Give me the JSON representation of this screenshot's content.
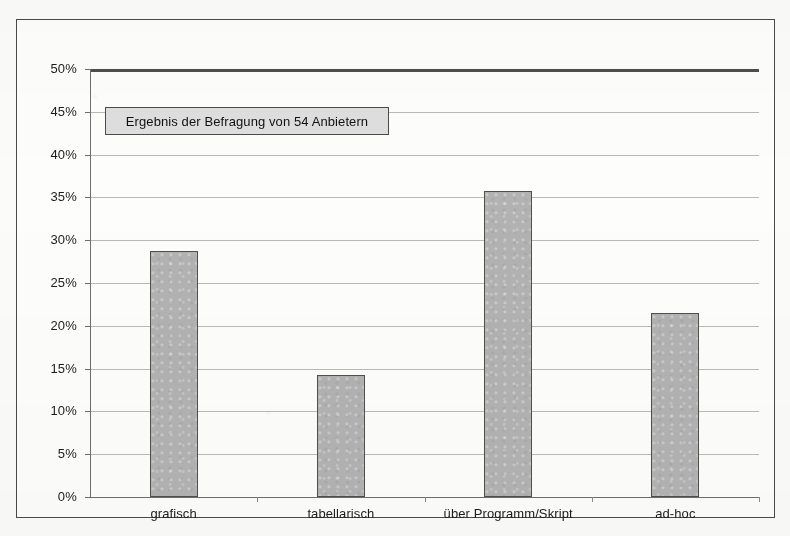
{
  "chart_data": {
    "type": "bar",
    "title": "",
    "subtitle": "",
    "xlabel": "",
    "ylabel": "",
    "categories": [
      "grafisch",
      "tabellarisch",
      "über Programm/Skript",
      "ad-hoc"
    ],
    "values": [
      28.7,
      14.3,
      35.7,
      21.5
    ],
    "value_unit": "%",
    "ylim": [
      0,
      50
    ],
    "ytick_labels": [
      "0%",
      "5%",
      "10%",
      "15%",
      "20%",
      "25%",
      "30%",
      "35%",
      "40%",
      "45%",
      "50%"
    ],
    "ytick_values": [
      0,
      5,
      10,
      15,
      20,
      25,
      30,
      35,
      40,
      45,
      50
    ],
    "grid": true,
    "grid_axis": "y",
    "legend": false,
    "legend_position": "none",
    "annotations": [
      {
        "name": "survey-note",
        "text": "Ergebnis der Befragung von 54 Anbietern"
      }
    ],
    "series": [
      {
        "name": "Anteil",
        "values": [
          28.7,
          14.3,
          35.7,
          21.5
        ]
      }
    ]
  },
  "colors": {
    "bar_fill": "#b2b2b2",
    "bar_border": "#4f4f4f",
    "gridline": "#b9b9b9",
    "axis": "#6e6e6e",
    "top_rule": "#4d4d4d",
    "frame": "#4a4a4a",
    "annotation_fill": "#dedede",
    "annotation_border": "#4b4b4b",
    "text": "#1d1d1d",
    "page_background": "#fbfbfa"
  }
}
